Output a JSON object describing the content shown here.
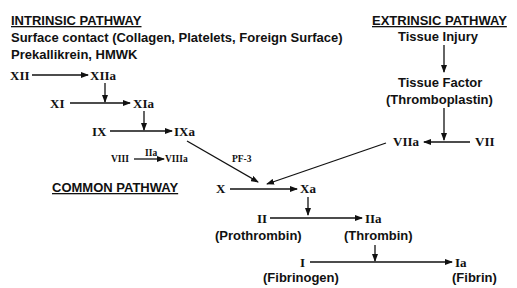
{
  "intrinsic": {
    "title": "INTRINSIC PATHWAY",
    "line1": "Surface contact (Collagen, Platelets, Foreign Surface)",
    "line2": "Prekallikrein,  HMWK",
    "factors": {
      "xii": "XII",
      "xiia": "XIIa",
      "xi": "XI",
      "xia": "XIa",
      "ix": "IX",
      "ixa": "IXa",
      "viii": "VIII",
      "viii_cofactor": "IIa",
      "viiia": "VIIIa"
    },
    "pf3": "PF-3"
  },
  "extrinsic": {
    "title": "EXTRINSIC PATHWAY",
    "tissue_injury": "Tissue Injury",
    "tissue_factor": "Tissue Factor",
    "thromboplastin": "(Thromboplastin)",
    "viia": "VIIa",
    "vii": "VII"
  },
  "common": {
    "title": "COMMON PATHWAY",
    "x": "X",
    "xa": "Xa",
    "ii": "II",
    "ii_name": "(Prothrombin)",
    "iia": "IIa",
    "iia_name": "(Thrombin)",
    "i": "I",
    "i_name": "(Fibrinogen)",
    "ia": "Ia",
    "ia_name": "(Fibrin)"
  }
}
